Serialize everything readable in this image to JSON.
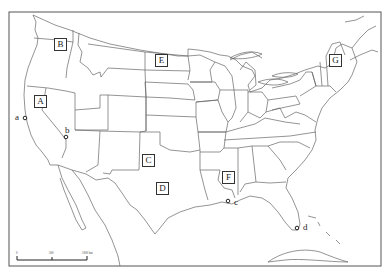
{
  "map": {
    "title": "",
    "subject": "Contiguous United States outline map with state boundaries",
    "frame": {
      "left": 9,
      "top": 12,
      "right": 381,
      "bottom": 266
    },
    "line_color": "#555555",
    "background": "#ffffff"
  },
  "region_labels": [
    {
      "id": "A",
      "label": "A",
      "x": 40,
      "y": 101
    },
    {
      "id": "B",
      "label": "B",
      "x": 60,
      "y": 44
    },
    {
      "id": "C",
      "label": "C",
      "x": 148,
      "y": 160
    },
    {
      "id": "D",
      "label": "D",
      "x": 162,
      "y": 188
    },
    {
      "id": "E",
      "label": "E",
      "x": 161,
      "y": 60
    },
    {
      "id": "F",
      "label": "F",
      "x": 228,
      "y": 177
    },
    {
      "id": "G",
      "label": "G",
      "x": 335,
      "y": 60
    }
  ],
  "point_markers": [
    {
      "id": "a",
      "label": "a",
      "x": 25,
      "y": 118,
      "label_x": 15,
      "label_y": 113
    },
    {
      "id": "b",
      "label": "b",
      "x": 66,
      "y": 137,
      "label_x": 65,
      "label_y": 126
    },
    {
      "id": "c",
      "label": "c",
      "x": 228,
      "y": 201,
      "label_x": 234,
      "label_y": 198
    },
    {
      "id": "d",
      "label": "d",
      "x": 297,
      "y": 228,
      "label_x": 303,
      "label_y": 223
    }
  ],
  "scale_bar": {
    "x_start": 17,
    "x_end": 87,
    "y": 260,
    "ticks": [
      "0",
      "500",
      "1000 km"
    ]
  }
}
